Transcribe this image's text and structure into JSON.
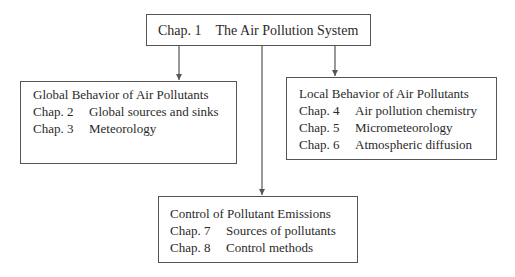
{
  "diagram": {
    "top": {
      "chapter": "Chap. 1",
      "title": "The Air Pollution System"
    },
    "left": {
      "heading": "Global Behavior of Air Pollutants",
      "items": [
        {
          "chapter": "Chap. 2",
          "title": "Global sources and sinks"
        },
        {
          "chapter": "Chap. 3",
          "title": "Meteorology"
        }
      ]
    },
    "right": {
      "heading": "Local Behavior of Air Pollutants",
      "items": [
        {
          "chapter": "Chap. 4",
          "title": "Air pollution chemistry"
        },
        {
          "chapter": "Chap. 5",
          "title": "Micrometeorology"
        },
        {
          "chapter": "Chap. 6",
          "title": "Atmospheric diffusion"
        }
      ]
    },
    "bottom": {
      "heading": "Control of Pollutant Emissions",
      "items": [
        {
          "chapter": "Chap. 7",
          "title": "Sources of pollutants"
        },
        {
          "chapter": "Chap. 8",
          "title": "Control methods"
        }
      ]
    },
    "colors": {
      "line": "#555555",
      "text": "#2a2a2a",
      "background": "#ffffff"
    }
  }
}
